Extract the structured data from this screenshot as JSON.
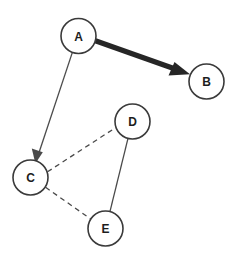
{
  "diagram": {
    "type": "node-link-graph",
    "background_color": "#ffffff",
    "canvas": {
      "width": 237,
      "height": 258
    },
    "nodes": [
      {
        "id": "A",
        "label": "A",
        "cx": 78.5,
        "cy": 36,
        "r": 17.5,
        "fill": "#ffffff",
        "stroke": "#3a3a3a"
      },
      {
        "id": "B",
        "label": "B",
        "cx": 206.5,
        "cy": 81.5,
        "r": 17.5,
        "fill": "#ffffff",
        "stroke": "#3a3a3a"
      },
      {
        "id": "C",
        "label": "C",
        "cx": 30.5,
        "cy": 177.5,
        "r": 17.5,
        "fill": "#ffffff",
        "stroke": "#3a3a3a"
      },
      {
        "id": "D",
        "label": "D",
        "cx": 132.5,
        "cy": 121.5,
        "r": 17.5,
        "fill": "#ffffff",
        "stroke": "#3a3a3a"
      },
      {
        "id": "E",
        "label": "E",
        "cx": 105.5,
        "cy": 228.5,
        "r": 17.5,
        "fill": "#ffffff",
        "stroke": "#3a3a3a"
      }
    ],
    "edges": [
      {
        "id": "A-B",
        "from": "A",
        "to": "B",
        "style": "solid",
        "weight": "thick",
        "directed": true,
        "color": "#262626"
      },
      {
        "id": "A-C",
        "from": "A",
        "to": "C",
        "style": "solid",
        "weight": "thin",
        "directed": true,
        "color": "#4a4a4a"
      },
      {
        "id": "C-D",
        "from": "C",
        "to": "D",
        "style": "dashed",
        "weight": "thin",
        "directed": false,
        "color": "#4a4a4a"
      },
      {
        "id": "C-E",
        "from": "C",
        "to": "E",
        "style": "dashed",
        "weight": "thin",
        "directed": false,
        "color": "#4a4a4a"
      },
      {
        "id": "D-E",
        "from": "D",
        "to": "E",
        "style": "solid",
        "weight": "thin",
        "directed": false,
        "color": "#4a4a4a"
      }
    ]
  }
}
